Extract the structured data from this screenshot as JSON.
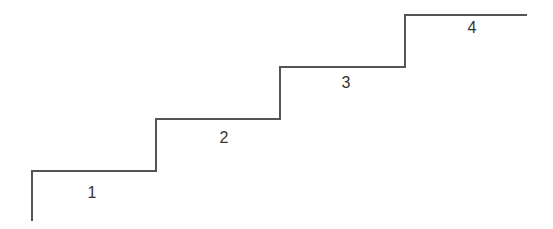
{
  "diagram": {
    "type": "staircase",
    "line_color": "#555555",
    "line_width": 2,
    "path_points": [
      [
        32,
        221
      ],
      [
        32,
        171
      ],
      [
        156,
        171
      ],
      [
        156,
        119
      ],
      [
        280,
        119
      ],
      [
        280,
        67
      ],
      [
        405,
        67
      ],
      [
        405,
        15
      ],
      [
        527,
        15
      ]
    ],
    "steps": [
      {
        "label": "1",
        "x": 92,
        "y": 198
      },
      {
        "label": "2",
        "x": 224,
        "y": 143
      },
      {
        "label": "3",
        "x": 346,
        "y": 88
      },
      {
        "label": "4",
        "x": 472,
        "y": 33
      }
    ]
  }
}
